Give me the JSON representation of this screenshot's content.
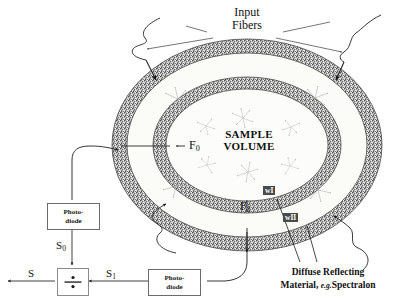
{
  "figure": {
    "background_color": "#ffffff",
    "ink_color": "#111111",
    "ring_fill_color": "#6e6e6e",
    "ring_outline_color": "#4a4a4a",
    "cavity_fill_color": "#fbfbf8",
    "scatter_color": "#9a9a9a"
  },
  "labels": {
    "input_fibers_line1": "Input",
    "input_fibers_line2": "Fibers",
    "sample_volume_line1": "SAMPLE",
    "sample_volume_line2": "VOLUME",
    "f0": "F",
    "f0_sub": "0",
    "f1": "F",
    "f1_sub": "1",
    "wall_inner": "wI",
    "wall_outer": "wII",
    "caption_line1": "Diffuse Reflecting",
    "caption_line2_a": "Material, ",
    "caption_line2_b": "e.g.",
    "caption_line2_c": "Spectralon"
  },
  "detector_chain": {
    "photodiode_top": {
      "line1": "Photo-",
      "line2": "diode"
    },
    "photodiode_bottom": {
      "line1": "Photo-",
      "line2": "diode"
    },
    "signal_s0": "S",
    "signal_s0_sub": "0",
    "signal_s1": "S",
    "signal_s1_sub": "1",
    "signal_s": "S",
    "divider_symbol": "÷"
  }
}
